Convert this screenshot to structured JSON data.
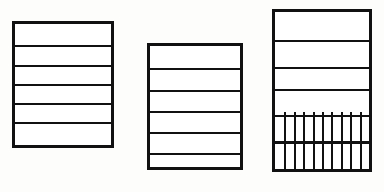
{
  "canvas": {
    "width": 384,
    "height": 192,
    "background_color": "#fdfdfc",
    "ink_color": "#111111"
  },
  "figure": {
    "shape_count": 3
  },
  "shapes": [
    {
      "id": "table-left",
      "label": "left-table",
      "x": 12,
      "y": 21,
      "width": 102,
      "height": 127,
      "border_width": 3,
      "border_color": "#111111",
      "fill_color": "#ffffff",
      "row_count": 6,
      "row_dividers": [
        21,
        41,
        60,
        79,
        98
      ],
      "divider_thickness": 2,
      "has_column_grid": false,
      "column_dividers": []
    },
    {
      "id": "table-middle",
      "label": "middle-table",
      "x": 147,
      "y": 43,
      "width": 96,
      "height": 127,
      "border_width": 3,
      "border_color": "#111111",
      "fill_color": "#ffffff",
      "row_count": 6,
      "row_dividers": [
        22,
        44,
        65,
        86,
        107
      ],
      "divider_thickness": 2,
      "has_column_grid": false,
      "column_dividers": []
    },
    {
      "id": "table-right",
      "label": "right-table-with-grid",
      "x": 272,
      "y": 9,
      "width": 100,
      "height": 163,
      "border_width": 3,
      "border_color": "#111111",
      "fill_color": "#ffffff",
      "row_count": 6,
      "row_dividers": [
        28,
        55,
        77,
        103,
        130
      ],
      "divider_thickness": 2,
      "has_column_grid": true,
      "grid_zone": {
        "top": 103,
        "bottom": 163,
        "columns": 10,
        "rows": 2,
        "column_dividers": [
          10,
          20,
          30,
          40,
          50,
          60,
          70,
          80,
          90
        ],
        "column_thickness": 2
      }
    }
  ]
}
